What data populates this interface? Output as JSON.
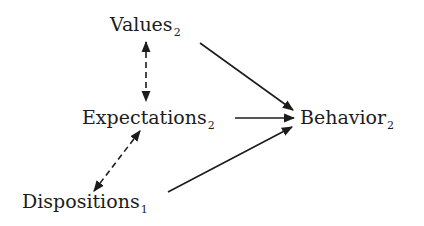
{
  "diagram": {
    "nodes": [
      {
        "id": "values",
        "label": "Values",
        "subscript": "2"
      },
      {
        "id": "expectations",
        "label": "Expectations",
        "subscript": "2"
      },
      {
        "id": "behavior",
        "label": "Behavior",
        "subscript": "2"
      },
      {
        "id": "dispositions",
        "label": "Dispositions",
        "subscript": "1"
      }
    ],
    "edges": [
      {
        "from": "values",
        "to": "behavior",
        "style": "solid",
        "direction": "forward"
      },
      {
        "from": "expectations",
        "to": "behavior",
        "style": "solid",
        "direction": "forward"
      },
      {
        "from": "dispositions",
        "to": "behavior",
        "style": "solid",
        "direction": "forward"
      },
      {
        "from": "values",
        "to": "expectations",
        "style": "dashed",
        "direction": "bidirectional"
      },
      {
        "from": "expectations",
        "to": "dispositions",
        "style": "dashed",
        "direction": "bidirectional"
      }
    ],
    "colors": {
      "ink": "#1c1c1c",
      "background": "#ffffff"
    }
  }
}
